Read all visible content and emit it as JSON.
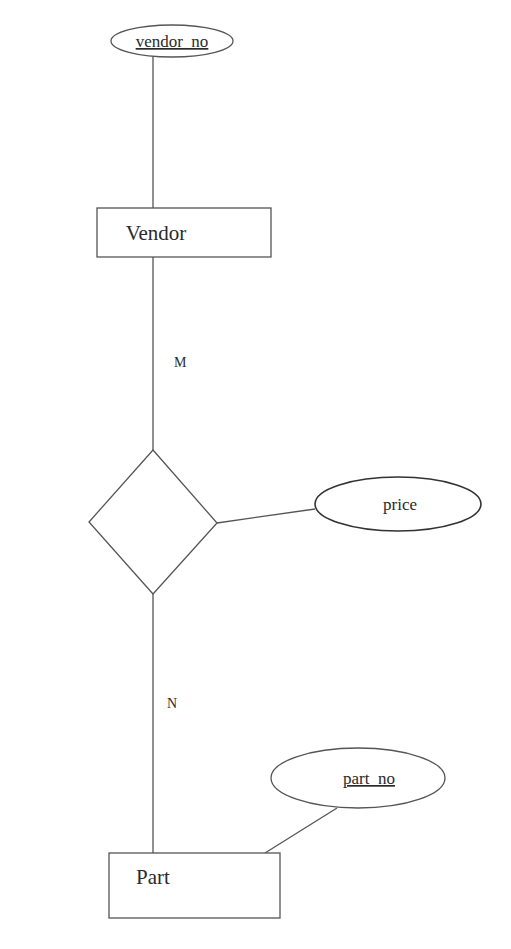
{
  "diagram": {
    "type": "er-diagram",
    "entities": [
      {
        "id": "vendor",
        "label": "Vendor"
      },
      {
        "id": "part",
        "label": "Part"
      }
    ],
    "relationships": [
      {
        "id": "supplies",
        "label": "",
        "between": [
          "vendor",
          "part"
        ]
      }
    ],
    "attributes": [
      {
        "id": "vendor_no",
        "label": "vendor_no",
        "owner": "vendor",
        "key": true
      },
      {
        "id": "price",
        "label": "price",
        "owner": "supplies",
        "key": false
      },
      {
        "id": "part_no",
        "label": "part_no",
        "owner": "part",
        "key": true
      }
    ],
    "cardinalities": {
      "vendor_side": "M",
      "part_side": "N"
    }
  },
  "colors": {
    "stroke": "#555555",
    "text": "#2a2a2a",
    "background": "#ffffff"
  }
}
